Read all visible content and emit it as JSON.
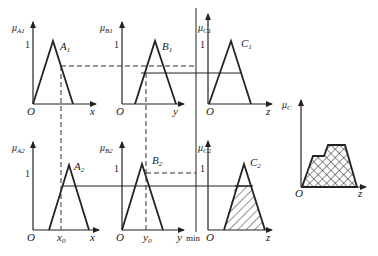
{
  "diagram": {
    "title": "",
    "rules_row1": {
      "antecedent_a": {
        "axis_label": "μ",
        "axis_sub": "A1",
        "set_label": "A",
        "set_sub": "1",
        "x_label": "x",
        "origin": "O",
        "one": "1"
      },
      "antecedent_b": {
        "axis_label": "μ",
        "axis_sub": "B1",
        "set_label": "B",
        "set_sub": "1",
        "x_label": "y",
        "origin": "O",
        "one": "1"
      },
      "consequent": {
        "axis_label": "μ",
        "axis_sub": "C1",
        "set_label": "C",
        "set_sub": "1",
        "x_label": "z",
        "origin": "O",
        "one": "1"
      }
    },
    "rules_row2": {
      "antecedent_a": {
        "axis_label": "μ",
        "axis_sub": "A2",
        "set_label": "A",
        "set_sub": "2",
        "x_label": "x",
        "input_label": "x",
        "input_sub": "0",
        "origin": "O",
        "one": "1"
      },
      "antecedent_b": {
        "axis_label": "μ",
        "axis_sub": "B2",
        "set_label": "B",
        "set_sub": "2",
        "x_label": "y",
        "input_label": "y",
        "input_sub": "0",
        "origin": "O",
        "one": "1"
      },
      "consequent": {
        "axis_label": "μ",
        "axis_sub": "C2",
        "set_label": "C",
        "set_sub": "2",
        "x_label": "z",
        "origin": "O",
        "one": "1"
      }
    },
    "operator_label": "min",
    "aggregate": {
      "axis_label": "μ",
      "axis_sub": "C",
      "x_label": "z",
      "origin": "O"
    },
    "colors": {
      "line": "#222222",
      "dashed": "#333333",
      "hatch": "#222222"
    }
  }
}
